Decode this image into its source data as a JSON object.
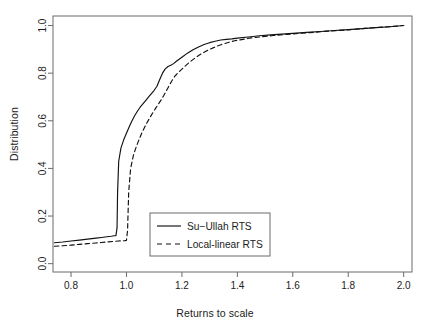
{
  "chart_data": {
    "type": "line",
    "title": "",
    "xlabel": "Returns to scale",
    "ylabel": "Distribution",
    "xlim": [
      0.735,
      2.03
    ],
    "ylim": [
      -0.035,
      1.04
    ],
    "xticks": [
      "0.8",
      "1.0",
      "1.2",
      "1.4",
      "1.6",
      "1.8",
      "2.0"
    ],
    "xtick_values": [
      0.8,
      1.0,
      1.2,
      1.4,
      1.6,
      1.8,
      2.0
    ],
    "yticks": [
      "0.0",
      "0.2",
      "0.4",
      "0.6",
      "0.8",
      "1.0"
    ],
    "ytick_values": [
      0.0,
      0.2,
      0.4,
      0.6,
      0.8,
      1.0
    ],
    "grid": false,
    "legend_position": "center-left-lower",
    "series": [
      {
        "name": "Su-Ullah RTS",
        "style": "solid",
        "color": "#111111",
        "x": [
          0.74,
          0.77,
          0.8,
          0.83,
          0.86,
          0.89,
          0.91,
          0.93,
          0.945,
          0.955,
          0.962,
          0.966,
          0.968,
          0.972,
          0.98,
          0.99,
          1.0,
          1.01,
          1.02,
          1.03,
          1.04,
          1.05,
          1.06,
          1.07,
          1.08,
          1.09,
          1.1,
          1.11,
          1.12,
          1.13,
          1.14,
          1.15,
          1.16,
          1.17,
          1.18,
          1.2,
          1.22,
          1.24,
          1.26,
          1.28,
          1.3,
          1.32,
          1.34,
          1.36,
          1.38,
          1.4,
          1.44,
          1.48,
          1.52,
          1.56,
          1.6,
          1.65,
          1.7,
          1.75,
          1.8,
          1.85,
          1.9,
          1.95,
          2.0
        ],
        "y": [
          0.088,
          0.091,
          0.095,
          0.099,
          0.103,
          0.107,
          0.11,
          0.113,
          0.115,
          0.117,
          0.118,
          0.15,
          0.3,
          0.43,
          0.485,
          0.52,
          0.548,
          0.575,
          0.6,
          0.622,
          0.641,
          0.658,
          0.672,
          0.686,
          0.7,
          0.714,
          0.728,
          0.745,
          0.773,
          0.8,
          0.818,
          0.828,
          0.833,
          0.84,
          0.85,
          0.867,
          0.884,
          0.898,
          0.91,
          0.92,
          0.928,
          0.934,
          0.939,
          0.942,
          0.944,
          0.947,
          0.952,
          0.957,
          0.961,
          0.964,
          0.967,
          0.971,
          0.975,
          0.979,
          0.983,
          0.987,
          0.991,
          0.995,
          1.0
        ]
      },
      {
        "name": "Local-linear RTS",
        "style": "dashed",
        "color": "#111111",
        "x": [
          0.74,
          0.77,
          0.8,
          0.83,
          0.86,
          0.89,
          0.91,
          0.93,
          0.95,
          0.97,
          0.985,
          0.995,
          1.0,
          1.004,
          1.008,
          1.015,
          1.025,
          1.035,
          1.045,
          1.055,
          1.065,
          1.075,
          1.085,
          1.095,
          1.105,
          1.115,
          1.125,
          1.135,
          1.145,
          1.155,
          1.165,
          1.175,
          1.19,
          1.21,
          1.23,
          1.25,
          1.27,
          1.29,
          1.31,
          1.33,
          1.35,
          1.37,
          1.39,
          1.41,
          1.45,
          1.49,
          1.53,
          1.57,
          1.61,
          1.66,
          1.71,
          1.76,
          1.81,
          1.86,
          1.91,
          1.96,
          2.0
        ],
        "y": [
          0.073,
          0.075,
          0.078,
          0.081,
          0.084,
          0.087,
          0.089,
          0.091,
          0.093,
          0.095,
          0.096,
          0.097,
          0.098,
          0.14,
          0.3,
          0.4,
          0.455,
          0.49,
          0.52,
          0.548,
          0.572,
          0.594,
          0.614,
          0.634,
          0.652,
          0.67,
          0.688,
          0.707,
          0.728,
          0.75,
          0.77,
          0.788,
          0.806,
          0.828,
          0.848,
          0.866,
          0.881,
          0.894,
          0.905,
          0.915,
          0.923,
          0.93,
          0.936,
          0.94,
          0.948,
          0.953,
          0.958,
          0.962,
          0.966,
          0.97,
          0.975,
          0.979,
          0.983,
          0.988,
          0.992,
          0.996,
          1.0
        ]
      }
    ]
  },
  "legend": {
    "entries": [
      {
        "label": "Su−Ullah RTS",
        "style": "solid"
      },
      {
        "label": "Local-linear RTS",
        "style": "dashed"
      }
    ]
  },
  "axes": {
    "x_label": "Returns to scale",
    "y_label": "Distribution",
    "x_tick_labels": [
      "0.8",
      "1.0",
      "1.2",
      "1.4",
      "1.6",
      "1.8",
      "2.0"
    ],
    "y_tick_labels": [
      "0.0",
      "0.2",
      "0.4",
      "0.6",
      "0.8",
      "1.0"
    ]
  },
  "style": {
    "line_color": "#111111",
    "axis_color": "#5a5a5a",
    "background": "#ffffff"
  }
}
